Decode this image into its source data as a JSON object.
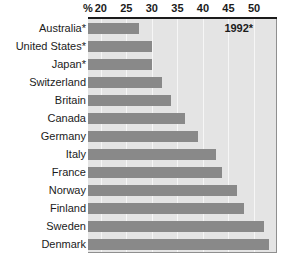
{
  "chart_data": {
    "type": "bar",
    "orientation": "horizontal",
    "title": "",
    "xlabel": "%",
    "ylabel": "",
    "xlim": [
      17.5,
      54.5
    ],
    "ticks": [
      20,
      25,
      30,
      35,
      40,
      45,
      50
    ],
    "tick_labels": [
      "20",
      "25",
      "30",
      "35",
      "40",
      "45",
      "50"
    ],
    "percent_symbol": "%",
    "grid": true,
    "grid_axis": "x",
    "legend": null,
    "annotation": "1992*",
    "bar_color": "#898989",
    "plot_background": "#e4e4e4",
    "categories": [
      "Australia*",
      "United States*",
      "Japan*",
      "Switzerland",
      "Britain",
      "Canada",
      "Germany",
      "Italy",
      "France",
      "Norway",
      "Finland",
      "Sweden",
      "Denmark"
    ],
    "values": [
      27.5,
      30.0,
      30.0,
      32.0,
      33.8,
      36.5,
      39.0,
      42.5,
      43.8,
      46.6,
      48.0,
      52.0,
      53.0
    ]
  }
}
